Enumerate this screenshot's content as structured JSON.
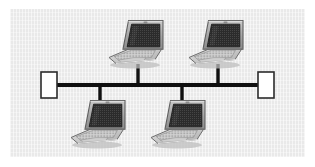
{
  "diagram": {
    "type": "network-topology",
    "topology_name": "bus",
    "title": "",
    "background_color": "#e9e9e9",
    "page_color": "#ffffff",
    "bus": {
      "line_color": "#111111",
      "line_thickness": 4,
      "y": 85,
      "x_start": 55,
      "x_end": 260
    },
    "terminators": [
      {
        "id": "terminator-left",
        "label": "",
        "x": 41,
        "y": 72,
        "width": 16,
        "height": 26,
        "fill": "#ffffff",
        "stroke": "#2b2b2b"
      },
      {
        "id": "terminator-right",
        "label": "",
        "x": 258,
        "y": 72,
        "width": 16,
        "height": 26,
        "fill": "#ffffff",
        "stroke": "#2b2b2b"
      }
    ],
    "nodes": [
      {
        "id": "laptop-top-left",
        "device": "laptop",
        "label": "",
        "x": 110,
        "y": 18,
        "drop_x": 138,
        "drop_from_y": 68,
        "drop_to_y": 85,
        "position": "above-bus"
      },
      {
        "id": "laptop-top-right",
        "device": "laptop",
        "label": "",
        "x": 190,
        "y": 18,
        "drop_x": 218,
        "drop_from_y": 68,
        "drop_to_y": 85,
        "position": "above-bus"
      },
      {
        "id": "laptop-bottom-left",
        "device": "laptop",
        "label": "",
        "x": 72,
        "y": 98,
        "drop_x": 100,
        "drop_from_y": 85,
        "drop_to_y": 100,
        "position": "below-bus"
      },
      {
        "id": "laptop-bottom-right",
        "device": "laptop",
        "label": "",
        "x": 152,
        "y": 98,
        "drop_x": 182,
        "drop_from_y": 85,
        "drop_to_y": 100,
        "position": "below-bus"
      }
    ],
    "palette": {
      "screen_dark": "#2e2e2e",
      "screen_speckle": "#4a4a4a",
      "bezel_gray": "#9a9a9a",
      "bezel_highlight": "#c4c4c4",
      "bezel_shadow": "#6f6f6f",
      "base_light": "#d2d2d2",
      "base_mid": "#b6b6b6",
      "base_shadow": "#8e8e8e",
      "outline": "#5a5a5a",
      "cable": "#111111"
    }
  }
}
